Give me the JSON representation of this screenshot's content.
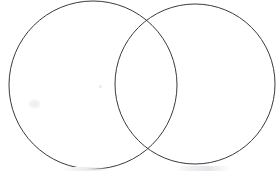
{
  "document": {
    "kind": "venn-diagram",
    "title": "",
    "background_color": "#ffffff",
    "width": 276,
    "height": 176
  },
  "diagram": {
    "stroke_color": "#3a3a3a",
    "stroke_width": 1,
    "fill": "none",
    "left_circle": {
      "label": "",
      "cx": 93,
      "cy": 85,
      "r": 84
    },
    "right_circle": {
      "label": "",
      "cx": 195,
      "cy": 84,
      "r": 80
    },
    "overlap_region": {
      "label": "",
      "top_intersection_x": 146,
      "top_intersection_y": 23,
      "bottom_intersection_x": 146,
      "bottom_intersection_y": 145
    }
  },
  "artifacts": {
    "ink_dot": "",
    "paper_smudge": "",
    "caption_remnant_left": "",
    "caption_remnant_right": ""
  },
  "chart_data": {
    "type": "venn",
    "title": "",
    "sets": [
      {
        "name": "",
        "cx": 93,
        "cy": 85,
        "r": 84
      },
      {
        "name": "",
        "cx": 195,
        "cy": 84,
        "r": 80
      }
    ],
    "labels": [],
    "values": [],
    "annotations": [],
    "legend": "none",
    "grid": false
  }
}
